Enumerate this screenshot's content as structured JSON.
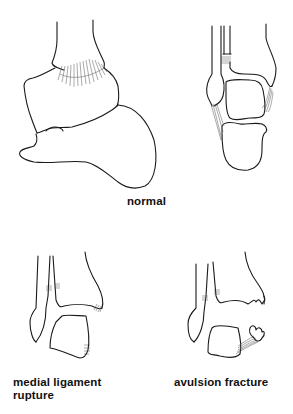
{
  "figure": {
    "type": "ankle anatomy line illustration",
    "panels": [
      {
        "id": "normal",
        "label": "normal",
        "views": [
          "lateral view of ankle",
          "anterior view of ankle"
        ]
      },
      {
        "id": "medial-ligament-rupture",
        "label": "medial ligament rupture"
      },
      {
        "id": "avulsion-fracture",
        "label": "avulsion fracture"
      }
    ]
  },
  "labels": {
    "normal": "normal",
    "medial": "medial ligament rupture",
    "avulsion": "avulsion fracture"
  },
  "colors": {
    "background": "#ffffff",
    "ink": "#1a1a1a"
  }
}
